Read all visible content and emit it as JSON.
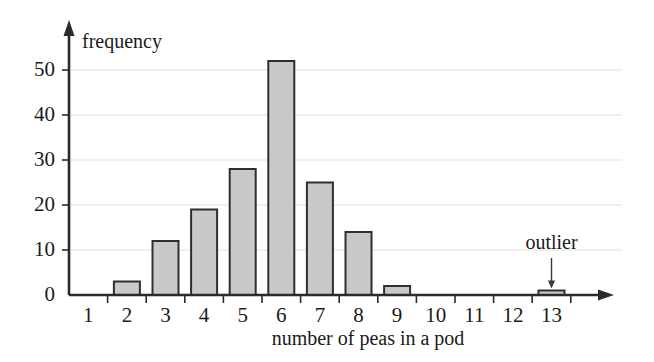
{
  "chart_data": {
    "type": "bar",
    "title": "",
    "subtitle": "",
    "xlabel": "number of peas in a pod",
    "ylabel": "frequency",
    "categories": [
      "1",
      "2",
      "3",
      "4",
      "5",
      "6",
      "7",
      "8",
      "9",
      "10",
      "11",
      "12",
      "13"
    ],
    "values": [
      0,
      3,
      12,
      19,
      28,
      52,
      25,
      14,
      2,
      0,
      0,
      0,
      1
    ],
    "xtick_labels": [
      "1",
      "2",
      "3",
      "4",
      "5",
      "6",
      "7",
      "8",
      "9",
      "10",
      "11",
      "12",
      "13"
    ],
    "ytick_labels": [
      "0",
      "10",
      "20",
      "30",
      "40",
      "50"
    ],
    "ytick_values": [
      0,
      10,
      20,
      30,
      40,
      50
    ],
    "ylim": [
      0,
      56
    ],
    "grid": "horizontal",
    "legend": "none",
    "annotations": [
      {
        "label": "outlier",
        "points_to_category": "13",
        "points_to_value": 1
      }
    ],
    "colors": {
      "bar_fill": "#c9c9c9",
      "bar_stroke": "#2f2f2f",
      "grid": "#e2e2e2",
      "axis": "#2b2b2b",
      "text": "#1a1a1a",
      "background": "#ffffff"
    }
  }
}
